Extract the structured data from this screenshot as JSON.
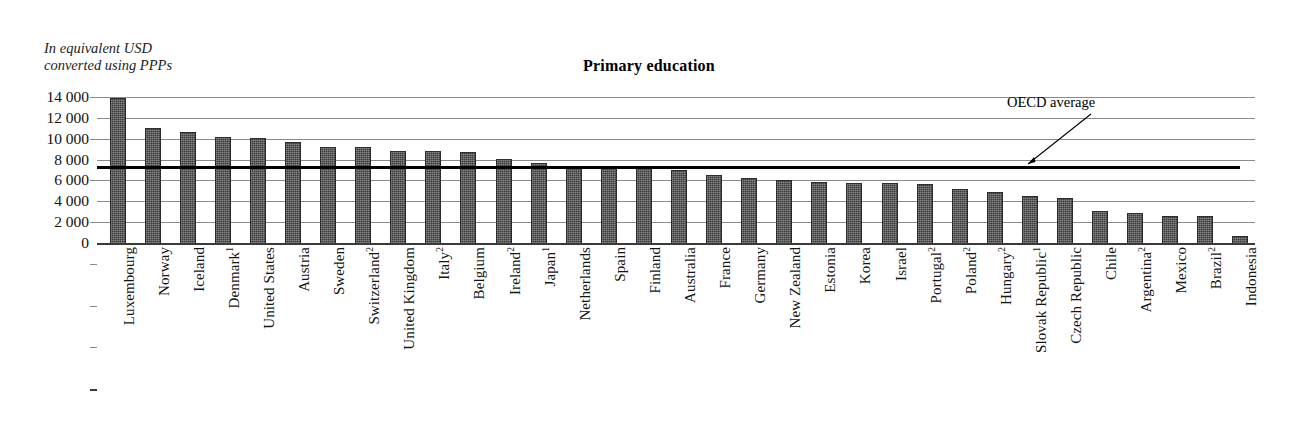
{
  "unit_note": "In equivalent USD\nconverted using PPPs",
  "title": "Primary education",
  "oecd": {
    "label": "OECD average",
    "value": 7200
  },
  "yaxis": {
    "ticks": [
      "14 000",
      "12 000",
      "10 000",
      "8 000",
      "6 000",
      "4 000",
      "2 000",
      "0"
    ],
    "tick_values": [
      14000,
      12000,
      10000,
      8000,
      6000,
      4000,
      2000,
      0
    ]
  },
  "chart_data": {
    "type": "bar",
    "title": "Primary education",
    "xlabel": "",
    "ylabel": "In equivalent USD converted using PPPs",
    "ylim": [
      0,
      14000
    ],
    "ytick_step": 2000,
    "grid": true,
    "legend": false,
    "annotations": [
      {
        "text": "OECD average",
        "value": 7200,
        "type": "reference-line"
      }
    ],
    "categories": [
      "Luxembourg",
      "Norway",
      "Iceland",
      "Denmark¹",
      "United States",
      "Austria",
      "Sweden",
      "Switzerland²",
      "United Kingdom",
      "Italy²",
      "Belgium",
      "Ireland²",
      "Japan¹",
      "Netherlands",
      "Spain",
      "Finland",
      "Australia",
      "France",
      "Germany",
      "New Zealand",
      "Estonia",
      "Korea",
      "Israel",
      "Portugal²",
      "Poland²",
      "Hungary²",
      "Slovak Republic¹",
      "Czech Republic",
      "Chile",
      "Argentina²",
      "Mexico",
      "Brazil²",
      "Indonesia"
    ],
    "values": [
      13800,
      10950,
      10550,
      10100,
      10000,
      9600,
      9100,
      9100,
      8750,
      8700,
      8600,
      7950,
      7600,
      7200,
      7200,
      7200,
      6900,
      6400,
      6100,
      5900,
      5800,
      5700,
      5650,
      5550,
      5100,
      4800,
      4400,
      4200,
      2950,
      2800,
      2500,
      2450,
      600
    ],
    "labels_plain": [
      "Luxembourg",
      "Norway",
      "Iceland",
      "Denmark",
      "United States",
      "Austria",
      "Sweden",
      "Switzerland",
      "United Kingdom",
      "Italy",
      "Belgium",
      "Ireland",
      "Japan",
      "Netherlands",
      "Spain",
      "Finland",
      "Australia",
      "France",
      "Germany",
      "New Zealand",
      "Estonia",
      "Korea",
      "Israel",
      "Portugal",
      "Poland",
      "Hungary",
      "Slovak Republic",
      "Czech Republic",
      "Chile",
      "Argentina",
      "Mexico",
      "Brazil",
      "Indonesia"
    ],
    "label_footnotes": [
      "",
      "",
      "",
      "1",
      "",
      "",
      "",
      "2",
      "",
      "2",
      "",
      "2",
      "1",
      "",
      "",
      "",
      "",
      "",
      "",
      "",
      "",
      "",
      "",
      "2",
      "2",
      "2",
      "1",
      "",
      "",
      "2",
      "",
      "2",
      ""
    ]
  },
  "colors": {
    "bar": "#3b3b3b",
    "gridline": "#8a8a8a",
    "axis": "#3a3a3a",
    "oecd_line": "#000000",
    "text": "#1a1a1a"
  }
}
